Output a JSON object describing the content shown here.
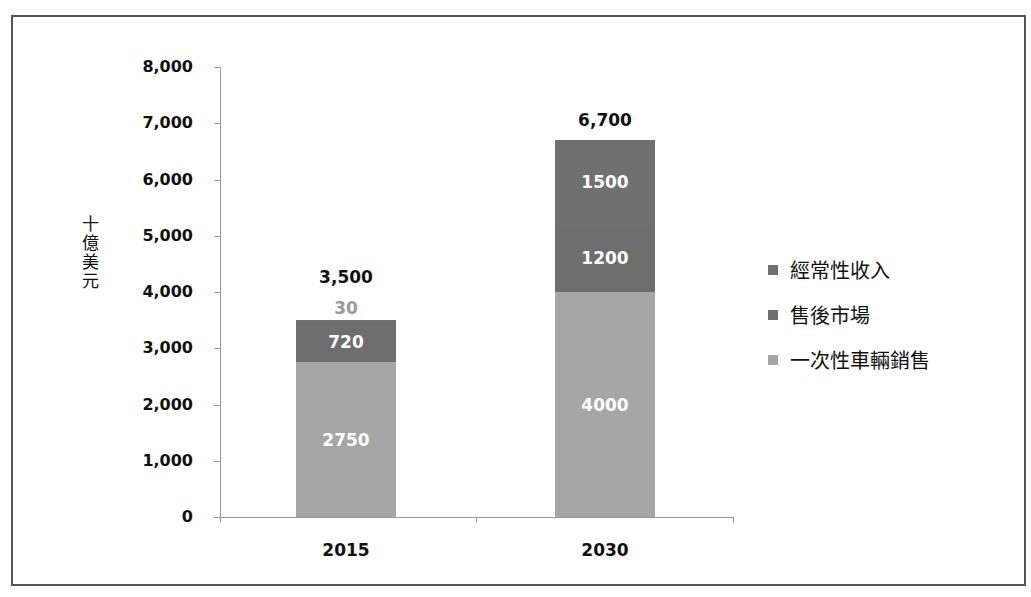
{
  "chart_data": {
    "type": "bar",
    "stacked": true,
    "title": "",
    "xlabel": "",
    "ylabel": "十億美元",
    "ylim": [
      0,
      8000
    ],
    "yticks": [
      "0",
      "1,000",
      "2,000",
      "3,000",
      "4,000",
      "5,000",
      "6,000",
      "7,000",
      "8,000"
    ],
    "categories": [
      "2015",
      "2030"
    ],
    "series": [
      {
        "name": "一次性車輛銷售",
        "values": [
          2750,
          4000
        ],
        "labels": [
          "2750",
          "4000"
        ],
        "color": "#a6a6a6"
      },
      {
        "name": "售後市場",
        "values": [
          720,
          1200
        ],
        "labels": [
          "720",
          "1200"
        ],
        "color": "#6e6e6e"
      },
      {
        "name": "經常性收入",
        "values": [
          30,
          1500
        ],
        "labels": [
          "30",
          "1500"
        ],
        "color": "#707070"
      }
    ],
    "totals": [
      "3,500",
      "6,700"
    ],
    "legend": {
      "position": "right",
      "entries": [
        "經常性收入",
        "售後市場",
        "一次性車輛銷售"
      ]
    },
    "grid": false
  }
}
